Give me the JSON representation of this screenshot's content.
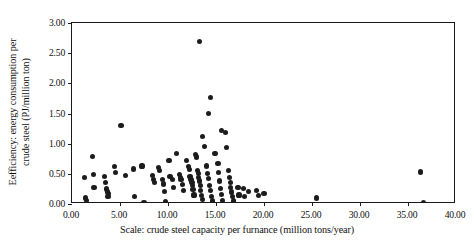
{
  "chart_data": {
    "type": "scatter",
    "title": "",
    "xlabel": "Scale: crude steel capacity per furnance  (million tons/year)",
    "ylabel_line1": "Eefficiency: energy consumption per",
    "ylabel_line2": "crude steel (PJ/million ton)",
    "xlim": [
      0.0,
      40.0
    ],
    "ylim": [
      0.0,
      3.0
    ],
    "xticks": [
      "0.00",
      "5.00",
      "10.00",
      "15.00",
      "20.00",
      "25.00",
      "30.00",
      "35.00",
      "40.00"
    ],
    "xtick_values": [
      0,
      5,
      10,
      15,
      20,
      25,
      30,
      35,
      40
    ],
    "yticks": [
      "0.00",
      "0.50",
      "1.00",
      "1.50",
      "2.00",
      "2.50",
      "3.00"
    ],
    "ytick_values": [
      0,
      0.5,
      1.0,
      1.5,
      2.0,
      2.5,
      3.0
    ],
    "grid": false,
    "legend": "none",
    "marker": "filled-circle",
    "marker_color": "#1c1c1c",
    "marker_size_px": 5.2,
    "n_points": 98,
    "points": [
      [
        1.3,
        0.44
      ],
      [
        1.4,
        0.1
      ],
      [
        1.5,
        0.06
      ],
      [
        2.1,
        0.79
      ],
      [
        2.2,
        0.49
      ],
      [
        2.3,
        0.28
      ],
      [
        3.4,
        0.46
      ],
      [
        3.5,
        0.35
      ],
      [
        3.6,
        0.25
      ],
      [
        3.7,
        0.2
      ],
      [
        3.8,
        0.17
      ],
      [
        3.75,
        0.12
      ],
      [
        4.4,
        0.62
      ],
      [
        4.5,
        0.52
      ],
      [
        5.1,
        1.3
      ],
      [
        5.6,
        0.47
      ],
      [
        6.4,
        0.58
      ],
      [
        6.5,
        0.12
      ],
      [
        7.3,
        0.63
      ],
      [
        7.5,
        0.03
      ],
      [
        8.4,
        0.47
      ],
      [
        8.5,
        0.41
      ],
      [
        8.6,
        0.36
      ],
      [
        9.0,
        0.6
      ],
      [
        9.1,
        0.55
      ],
      [
        9.4,
        0.4
      ],
      [
        9.5,
        0.33
      ],
      [
        9.6,
        0.21
      ],
      [
        9.7,
        0.04
      ],
      [
        10.1,
        0.72
      ],
      [
        10.2,
        0.46
      ],
      [
        10.5,
        0.41
      ],
      [
        10.6,
        0.27
      ],
      [
        10.9,
        0.84
      ],
      [
        11.2,
        0.49
      ],
      [
        11.3,
        0.44
      ],
      [
        11.35,
        0.4
      ],
      [
        11.5,
        0.32
      ],
      [
        11.6,
        0.22
      ],
      [
        11.9,
        0.72
      ],
      [
        12.1,
        0.62
      ],
      [
        12.2,
        0.57
      ],
      [
        12.3,
        0.46
      ],
      [
        12.4,
        0.41
      ],
      [
        12.5,
        0.36
      ],
      [
        12.55,
        0.31
      ],
      [
        12.6,
        0.24
      ],
      [
        12.7,
        0.15
      ],
      [
        12.9,
        0.82
      ],
      [
        13.0,
        0.78
      ],
      [
        13.1,
        0.55
      ],
      [
        13.15,
        0.5
      ],
      [
        13.2,
        0.44
      ],
      [
        13.3,
        0.38
      ],
      [
        13.35,
        0.3
      ],
      [
        13.4,
        0.22
      ],
      [
        13.5,
        0.14
      ],
      [
        13.6,
        0.07
      ],
      [
        13.3,
        2.7
      ],
      [
        13.6,
        1.12
      ],
      [
        13.8,
        0.95
      ],
      [
        14.0,
        0.63
      ],
      [
        14.1,
        0.5
      ],
      [
        14.2,
        0.42
      ],
      [
        14.3,
        0.31
      ],
      [
        14.4,
        0.22
      ],
      [
        14.5,
        0.12
      ],
      [
        14.6,
        0.05
      ],
      [
        14.9,
        0.84
      ],
      [
        15.2,
        0.67
      ],
      [
        15.3,
        0.52
      ],
      [
        15.4,
        0.38
      ],
      [
        15.5,
        0.26
      ],
      [
        15.6,
        0.16
      ],
      [
        15.7,
        0.06
      ],
      [
        14.2,
        1.5
      ],
      [
        14.4,
        1.76
      ],
      [
        15.6,
        1.22
      ],
      [
        16.0,
        1.18
      ],
      [
        16.1,
        0.93
      ],
      [
        16.3,
        0.55
      ],
      [
        16.4,
        0.44
      ],
      [
        16.5,
        0.36
      ],
      [
        16.55,
        0.28
      ],
      [
        16.6,
        0.2
      ],
      [
        16.7,
        0.12
      ],
      [
        16.8,
        0.05
      ],
      [
        17.3,
        0.28
      ],
      [
        17.4,
        0.15
      ],
      [
        17.9,
        0.26
      ],
      [
        18.0,
        0.13
      ],
      [
        18.4,
        0.21
      ],
      [
        19.2,
        0.23
      ],
      [
        19.4,
        0.14
      ],
      [
        20.0,
        0.18
      ],
      [
        25.5,
        0.1
      ],
      [
        36.3,
        0.53
      ],
      [
        36.6,
        0.03
      ]
    ]
  }
}
